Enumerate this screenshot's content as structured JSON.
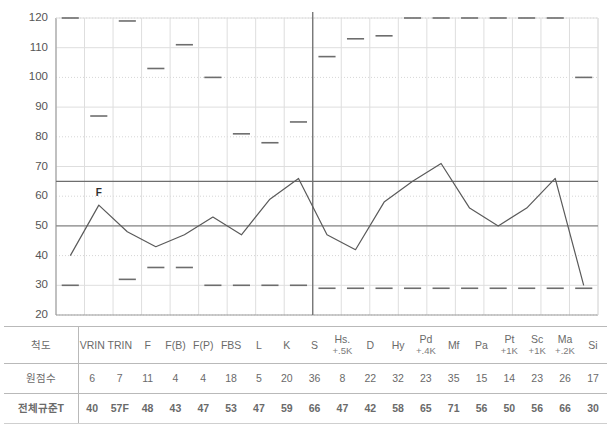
{
  "chart_data": {
    "type": "line",
    "title": "",
    "xlabel": "",
    "ylabel": "",
    "ylim": [
      20,
      120
    ],
    "ytick_step": 10,
    "yticks": [
      20,
      30,
      40,
      50,
      60,
      70,
      80,
      90,
      100,
      110,
      120
    ],
    "grid": true,
    "legend": "none",
    "annotations": [
      {
        "text": "F",
        "scale": "TRIN",
        "value": 57,
        "position": "above-point"
      }
    ],
    "reference_lines": [
      {
        "value": 65,
        "style": "solid",
        "color": "#6e6e6e"
      },
      {
        "value": 50,
        "style": "solid",
        "color": "#8a8a8a"
      }
    ],
    "divider_after_category": "S",
    "categories": [
      "VRIN",
      "TRIN",
      "F",
      "F(B)",
      "F(P)",
      "FBS",
      "L",
      "K",
      "S",
      "Hs",
      "D",
      "Hy",
      "Pd",
      "Mf",
      "Pa",
      "Pt",
      "Sc",
      "Ma",
      "Si"
    ],
    "series": [
      {
        "name": "전체규준T",
        "type": "line",
        "values": [
          40,
          57,
          48,
          43,
          47,
          53,
          47,
          59,
          66,
          47,
          42,
          58,
          65,
          71,
          56,
          50,
          56,
          66,
          30
        ]
      },
      {
        "name": "upper-marker",
        "type": "dash-marker",
        "values": [
          120,
          87,
          119,
          103,
          111,
          100,
          81,
          78,
          85,
          107,
          113,
          114,
          120,
          120,
          120,
          120,
          120,
          120,
          100
        ]
      },
      {
        "name": "lower-marker",
        "type": "dash-marker",
        "values": [
          30,
          null,
          32,
          36,
          36,
          30,
          30,
          30,
          30,
          29,
          29,
          29,
          29,
          29,
          29,
          29,
          29,
          29,
          29
        ]
      }
    ]
  },
  "table": {
    "row_labels": {
      "scale": "척도",
      "raw": "원점수",
      "tscore": "전체규준T"
    },
    "columns": [
      {
        "name": "VRIN",
        "sub": "",
        "raw": "6",
        "t": "40"
      },
      {
        "name": "TRIN",
        "sub": "",
        "raw": "7",
        "t": "57F"
      },
      {
        "name": "F",
        "sub": "",
        "raw": "11",
        "t": "48"
      },
      {
        "name": "F(B)",
        "sub": "",
        "raw": "4",
        "t": "43"
      },
      {
        "name": "F(P)",
        "sub": "",
        "raw": "4",
        "t": "47"
      },
      {
        "name": "FBS",
        "sub": "",
        "raw": "18",
        "t": "53"
      },
      {
        "name": "L",
        "sub": "",
        "raw": "5",
        "t": "47"
      },
      {
        "name": "K",
        "sub": "",
        "raw": "20",
        "t": "59"
      },
      {
        "name": "S",
        "sub": "",
        "raw": "36",
        "t": "66"
      },
      {
        "name": "Hs.",
        "sub": "+.5K",
        "raw": "8",
        "t": "47"
      },
      {
        "name": "D",
        "sub": "",
        "raw": "22",
        "t": "42"
      },
      {
        "name": "Hy",
        "sub": "",
        "raw": "32",
        "t": "58"
      },
      {
        "name": "Pd",
        "sub": "+.4K",
        "raw": "23",
        "t": "65"
      },
      {
        "name": "Mf",
        "sub": "",
        "raw": "35",
        "t": "71"
      },
      {
        "name": "Pa",
        "sub": "",
        "raw": "15",
        "t": "56"
      },
      {
        "name": "Pt",
        "sub": "+1K",
        "raw": "14",
        "t": "50"
      },
      {
        "name": "Sc",
        "sub": "+1K",
        "raw": "23",
        "t": "56"
      },
      {
        "name": "Ma",
        "sub": "+.2K",
        "raw": "26",
        "t": "66"
      },
      {
        "name": "Si",
        "sub": "",
        "raw": "17",
        "t": "30"
      }
    ]
  },
  "colors": {
    "line": "#5a5a5a",
    "marker": "#6d6d6d",
    "grid": "#dedede",
    "grid_dot": "#d6d6d6",
    "axis": "#9a9a9a",
    "reference": "#6e6e6e",
    "text": "#4a4a4a"
  }
}
